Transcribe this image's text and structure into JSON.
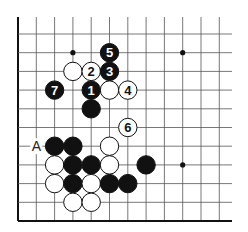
{
  "diagram": {
    "type": "go-board-corner",
    "board": {
      "columns": 12,
      "rows": 11,
      "origin_x": 18,
      "origin_y": 34,
      "col_spacing": 18.3,
      "row_spacing": 18.7,
      "edges": [
        "left",
        "bottom"
      ],
      "line_color": "#555555",
      "edge_color": "#111111"
    },
    "star_points": [
      {
        "col": 3,
        "row": 1
      },
      {
        "col": 9,
        "row": 1
      },
      {
        "col": 9,
        "row": 7
      }
    ],
    "stones": [
      {
        "color": "black",
        "col": 5,
        "row": 1,
        "label": "5"
      },
      {
        "color": "white",
        "col": 3,
        "row": 2,
        "label": ""
      },
      {
        "color": "white",
        "col": 4,
        "row": 2,
        "label": "2"
      },
      {
        "color": "black",
        "col": 5,
        "row": 2,
        "label": "3"
      },
      {
        "color": "black",
        "col": 2,
        "row": 3,
        "label": "7"
      },
      {
        "color": "black",
        "col": 4,
        "row": 3,
        "label": "1"
      },
      {
        "color": "white",
        "col": 5,
        "row": 3,
        "label": ""
      },
      {
        "color": "white",
        "col": 6,
        "row": 3,
        "label": "4"
      },
      {
        "color": "black",
        "col": 4,
        "row": 4,
        "label": ""
      },
      {
        "color": "white",
        "col": 6,
        "row": 5,
        "label": "6"
      },
      {
        "color": "black",
        "col": 2,
        "row": 6,
        "label": ""
      },
      {
        "color": "black",
        "col": 3,
        "row": 6,
        "label": ""
      },
      {
        "color": "white",
        "col": 5,
        "row": 6,
        "label": ""
      },
      {
        "color": "white",
        "col": 2,
        "row": 7,
        "label": ""
      },
      {
        "color": "black",
        "col": 3,
        "row": 7,
        "label": ""
      },
      {
        "color": "black",
        "col": 4,
        "row": 7,
        "label": ""
      },
      {
        "color": "white",
        "col": 5,
        "row": 7,
        "label": ""
      },
      {
        "color": "black",
        "col": 7,
        "row": 7,
        "label": ""
      },
      {
        "color": "white",
        "col": 2,
        "row": 8,
        "label": ""
      },
      {
        "color": "black",
        "col": 3,
        "row": 8,
        "label": ""
      },
      {
        "color": "white",
        "col": 4,
        "row": 8,
        "label": ""
      },
      {
        "color": "black",
        "col": 5,
        "row": 8,
        "label": ""
      },
      {
        "color": "black",
        "col": 6,
        "row": 8,
        "label": ""
      },
      {
        "color": "white",
        "col": 3,
        "row": 9,
        "label": ""
      },
      {
        "color": "white",
        "col": 4,
        "row": 9,
        "label": ""
      }
    ],
    "markers": [
      {
        "text": "A",
        "col": 1,
        "row": 6
      }
    ]
  }
}
